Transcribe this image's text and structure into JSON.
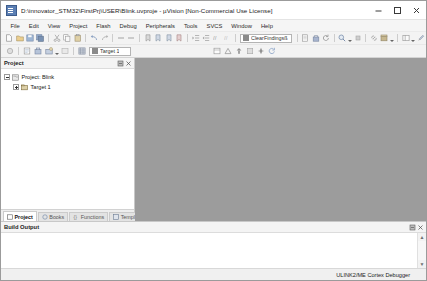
{
  "window": {
    "title": "D:\\innovator_STM32\\FirstPrj\\USER\\Blink.uvproje - µVision [Non-Commercial Use License]",
    "app_icon": "uvision-icon",
    "minimize_label": "Minimize",
    "maximize_label": "Maximize",
    "close_label": "Close"
  },
  "menubar": {
    "items": [
      {
        "label": "File"
      },
      {
        "label": "Edit"
      },
      {
        "label": "View"
      },
      {
        "label": "Project"
      },
      {
        "label": "Flash"
      },
      {
        "label": "Debug"
      },
      {
        "label": "Peripherals"
      },
      {
        "label": "Tools"
      },
      {
        "label": "SVCS"
      },
      {
        "label": "Window"
      },
      {
        "label": "Help"
      }
    ]
  },
  "toolbar_main": {
    "buttons": [
      {
        "name": "new-file-icon",
        "tip": "New"
      },
      {
        "name": "open-file-icon",
        "tip": "Open"
      },
      {
        "name": "save-icon",
        "tip": "Save"
      },
      {
        "name": "save-all-icon",
        "tip": "Save All"
      },
      {
        "name": "cut-icon",
        "tip": "Cut"
      },
      {
        "name": "copy-icon",
        "tip": "Copy"
      },
      {
        "name": "paste-icon",
        "tip": "Paste"
      },
      {
        "name": "undo-icon",
        "tip": "Undo"
      },
      {
        "name": "redo-icon",
        "tip": "Redo"
      },
      {
        "name": "nav-back-icon",
        "tip": "Back"
      },
      {
        "name": "nav-forward-icon",
        "tip": "Forward"
      },
      {
        "name": "bookmark-toggle-icon",
        "tip": "Toggle Bookmark"
      },
      {
        "name": "bookmark-prev-icon",
        "tip": "Previous Bookmark"
      },
      {
        "name": "bookmark-next-icon",
        "tip": "Next Bookmark"
      },
      {
        "name": "bookmark-clear-icon",
        "tip": "Clear Bookmarks"
      },
      {
        "name": "indent-icon",
        "tip": "Indent"
      },
      {
        "name": "outdent-icon",
        "tip": "Outdent"
      },
      {
        "name": "comment-icon",
        "tip": "Comment"
      },
      {
        "name": "uncomment-icon",
        "tip": "Uncomment"
      },
      {
        "name": "find-icon",
        "tip": "Find"
      },
      {
        "name": "find-in-files-icon",
        "tip": "Find in Files"
      }
    ],
    "findbox": {
      "icon": "binoculars-icon",
      "value": "ClearFindingsß",
      "placeholder": ""
    },
    "right_buttons": [
      {
        "name": "bookmark-list-icon",
        "tip": "Bookmarks"
      },
      {
        "name": "build-icon",
        "tip": "Build"
      },
      {
        "name": "rebuild-icon",
        "tip": "Rebuild"
      },
      {
        "name": "zoom-icon",
        "tip": "Zoom"
      },
      {
        "name": "stop-build-icon",
        "tip": "Stop Build"
      },
      {
        "name": "link-icon",
        "tip": "Configure"
      },
      {
        "name": "pack-installer-icon",
        "tip": "Pack Installer"
      },
      {
        "name": "window-layout-icon",
        "tip": "Window Layout"
      },
      {
        "name": "settings-icon",
        "tip": "Configuration Wizard"
      }
    ]
  },
  "toolbar_build": {
    "buttons": [
      {
        "name": "debug-start-icon",
        "tip": "Start/Stop Debug Session"
      },
      {
        "name": "translate-icon",
        "tip": "Translate"
      },
      {
        "name": "build-target-icon",
        "tip": "Build"
      },
      {
        "name": "rebuild-all-icon",
        "tip": "Rebuild All"
      },
      {
        "name": "batch-build-icon",
        "tip": "Batch Build"
      },
      {
        "name": "download-icon",
        "tip": "Download"
      },
      {
        "name": "target-options-icon",
        "tip": "Options for Target"
      }
    ],
    "target_combo": {
      "icon": "target-icon",
      "value": "Target 1"
    },
    "right_buttons": [
      {
        "name": "manage-project-icon",
        "tip": "Manage Project Items"
      },
      {
        "name": "run-to-main-icon",
        "tip": "Run to Main"
      },
      {
        "name": "multi-project-icon",
        "tip": "Multi-Project"
      },
      {
        "name": "pack-icon",
        "tip": "Select Software Packs"
      },
      {
        "name": "cursor-icon",
        "tip": "Insert/Remove Breakpoint"
      },
      {
        "name": "reset-icon",
        "tip": "Reset"
      }
    ]
  },
  "project_panel": {
    "title": "Project",
    "pin_label": "Auto Hide",
    "close_label": "Close",
    "tree": [
      {
        "label": "Project: Blink",
        "icon": "project-icon",
        "level": 1,
        "expander": "minus"
      },
      {
        "label": "Target 1",
        "icon": "target-folder-icon",
        "level": 2,
        "expander": "plus"
      }
    ],
    "tabs": [
      {
        "label": "Project",
        "icon": "project-tab-icon",
        "active": true
      },
      {
        "label": "Books",
        "icon": "books-icon",
        "active": false
      },
      {
        "label": "Functions",
        "icon": "functions-icon",
        "active": false
      },
      {
        "label": "Templates",
        "icon": "templates-icon",
        "active": false
      }
    ]
  },
  "build_output": {
    "title": "Build Output",
    "pin_label": "Auto Hide",
    "close_label": "Close",
    "text": "",
    "scroll_up": "▲",
    "scroll_down": "▼"
  },
  "statusbar": {
    "left_text": "",
    "debugger": "ULINK2/ME Cortex Debugger"
  },
  "colors": {
    "mdi_background": "#9c9c9c",
    "chrome": "#f0f0f0",
    "panel_header": "#f4f4f4",
    "accent": "#5b7fb4"
  }
}
